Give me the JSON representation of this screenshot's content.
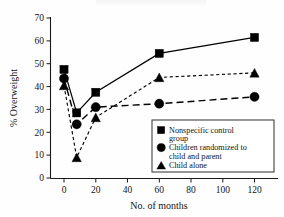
{
  "chart_data": {
    "type": "line",
    "title": "",
    "xlabel": "No. of months",
    "ylabel": "% Overweight",
    "xlim": [
      -6,
      135
    ],
    "ylim": [
      0,
      70
    ],
    "xticks": [
      0,
      20,
      40,
      60,
      80,
      100,
      120
    ],
    "yticks": [
      0,
      10,
      20,
      30,
      40,
      50,
      60,
      70
    ],
    "grid": false,
    "legend_position": "lower-right-inside",
    "x": [
      0,
      8,
      20,
      60,
      120
    ],
    "series": [
      {
        "name": "Nonspecific control group",
        "marker": "square",
        "linestyle": "solid",
        "values": [
          47.5,
          28.5,
          37.5,
          54.5,
          61.5
        ]
      },
      {
        "name": "Children randomized to child and parent",
        "marker": "circle",
        "linestyle": "long-dash",
        "values": [
          43.5,
          23.5,
          31.0,
          32.5,
          35.5
        ]
      },
      {
        "name": "Child alone",
        "marker": "triangle",
        "linestyle": "short-dash",
        "values": [
          40.5,
          9.0,
          26.5,
          44.0,
          46.0
        ]
      }
    ]
  },
  "axes": {
    "y_label": "% Overweight",
    "x_label": "No. of months",
    "y_tick_labels": [
      "0",
      "10",
      "20",
      "30",
      "40",
      "50",
      "60",
      "70"
    ],
    "x_tick_labels": [
      "0",
      "20",
      "40",
      "60",
      "80",
      "100",
      "120"
    ]
  },
  "legend": {
    "entries": [
      {
        "marker": "square-marker",
        "line1": "Nonspecific control",
        "line2": "group"
      },
      {
        "marker": "circle-marker",
        "line1": "Children randomized to",
        "line2": "child and parent"
      },
      {
        "marker": "triangle-marker",
        "line1": "Child alone",
        "line2": ""
      }
    ]
  },
  "colors": {
    "ink": "#000000",
    "background": "#ffffff"
  }
}
